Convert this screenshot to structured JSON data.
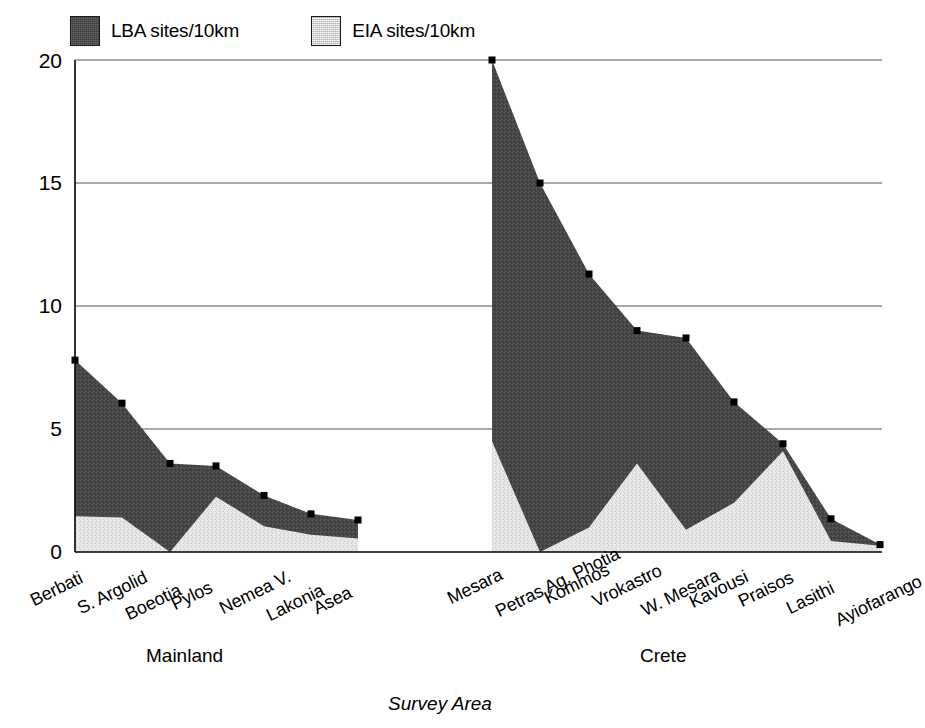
{
  "chart_data": {
    "type": "area",
    "title": "",
    "xlabel": "Survey Area",
    "ylabel": "",
    "ylim": [
      0,
      20
    ],
    "yticks": [
      0,
      5,
      10,
      15,
      20
    ],
    "grid": true,
    "legend_position": "top-left",
    "stacked": false,
    "note": "Two overlaid filled areas per region group; dark area is total LBA sites/10km, light area in front is EIA sites/10km.",
    "groups": [
      {
        "name": "Mainland",
        "categories": [
          "Berbati",
          "S. Argolid",
          "Boeotia",
          "Pylos",
          "Nemea V.",
          "Lakonia",
          "Asea"
        ],
        "series": [
          {
            "name": "LBA sites/10km",
            "values": [
              7.8,
              6.05,
              3.6,
              3.5,
              2.3,
              1.55,
              1.3
            ]
          },
          {
            "name": "EIA sites/10km",
            "values": [
              1.45,
              1.4,
              0.0,
              2.25,
              1.05,
              0.7,
              0.55
            ]
          }
        ]
      },
      {
        "name": "Crete",
        "categories": [
          "Mesara",
          "Petras Ag. Photia",
          "Kommos",
          "Vrokastro",
          "W. Mesara",
          "Kavousi",
          "Praisos",
          "Lasithi",
          "Ayiofarango"
        ],
        "series": [
          {
            "name": "LBA sites/10km",
            "values": [
              20.0,
              15.0,
              11.3,
              9.0,
              8.7,
              6.1,
              4.4,
              1.35,
              0.3
            ]
          },
          {
            "name": "EIA sites/10km",
            "values": [
              4.5,
              0.0,
              1.0,
              3.6,
              0.9,
              2.0,
              4.1,
              0.45,
              0.25
            ]
          }
        ]
      }
    ],
    "legend": [
      {
        "label": "LBA sites/10km",
        "swatch": "dark-gray"
      },
      {
        "label": "EIA sites/10km",
        "swatch": "light-gray"
      }
    ]
  },
  "legend": {
    "lba_label": "LBA sites/10km",
    "eia_label": "EIA sites/10km"
  },
  "axis": {
    "y_ticks": [
      "20",
      "15",
      "10",
      "5",
      "0"
    ],
    "x_title": "Survey Area"
  },
  "groups": {
    "mainland_label": "Mainland",
    "crete_label": "Crete"
  },
  "x_labels": {
    "mainland": [
      "Berbati",
      "S. Argolid",
      "Boeotia",
      "Pylos",
      "Nemea V.",
      "Lakonia",
      "Asea"
    ],
    "crete": [
      "Mesara",
      "Petras Ag. Photia",
      "Kommos",
      "Vrokastro",
      "W. Mesara",
      "Kavousi",
      "Praisos",
      "Lasithi",
      "Ayiofarango"
    ]
  },
  "colors": {
    "lba_fill": "#474747",
    "eia_fill": "#e2e2e2",
    "axis": "#000000",
    "grid": "#555555"
  }
}
